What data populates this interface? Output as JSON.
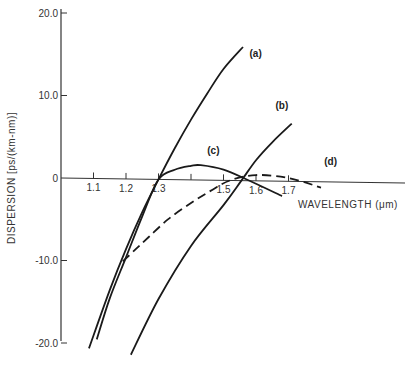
{
  "chart_data": {
    "type": "line",
    "title": "",
    "xlabel": "WAVELENGTH (μm)",
    "ylabel": "DISPERSION [ps/(km-nm)]",
    "xlim": [
      1.0,
      2.1
    ],
    "ylim": [
      -20.0,
      20.0
    ],
    "x_ticks": [
      1.1,
      1.2,
      1.3,
      1.4,
      1.5,
      1.6,
      1.7
    ],
    "x_tick_labels": [
      "1.1",
      "1.2",
      "1.3",
      "",
      "1.5",
      "1.6",
      "1.7"
    ],
    "y_ticks": [
      20.0,
      10.0,
      0,
      -10.0,
      -20.0
    ],
    "y_tick_labels": [
      "20.0",
      "10.0",
      "0",
      "-10.0",
      "-20.0"
    ],
    "grid": false,
    "legend": "inline labels",
    "series": [
      {
        "name": "(a)",
        "style": "solid",
        "x": [
          1.086,
          1.15,
          1.2,
          1.25,
          1.3,
          1.35,
          1.4,
          1.45,
          1.5,
          1.56
        ],
        "y": [
          -20.6,
          -13.5,
          -8.5,
          -4.0,
          0.0,
          3.8,
          7.3,
          10.5,
          13.5,
          16.2
        ]
      },
      {
        "name": "(b)",
        "style": "solid",
        "x": [
          1.215,
          1.3,
          1.4,
          1.5,
          1.555,
          1.6,
          1.65,
          1.71
        ],
        "y": [
          -21.3,
          -14.5,
          -8.0,
          -3.0,
          0.0,
          2.5,
          4.7,
          7.0
        ]
      },
      {
        "name": "(c)",
        "style": "solid",
        "x": [
          1.11,
          1.15,
          1.2,
          1.25,
          1.3,
          1.35,
          1.4,
          1.43,
          1.5,
          1.58,
          1.68
        ],
        "y": [
          -19.5,
          -14.5,
          -9.5,
          -4.5,
          0.0,
          1.2,
          1.7,
          1.8,
          1.3,
          0.0,
          -1.8
        ]
      },
      {
        "name": "(d)",
        "style": "dashed",
        "x": [
          1.19,
          1.23,
          1.27,
          1.33,
          1.4,
          1.46,
          1.52,
          1.6,
          1.7,
          1.8
        ],
        "y": [
          -10.0,
          -8.5,
          -7.0,
          -4.8,
          -2.8,
          -1.3,
          0.0,
          0.7,
          0.4,
          -0.7
        ]
      }
    ],
    "annotations": [
      {
        "text": "(a)",
        "x": 1.58,
        "y": 15.0
      },
      {
        "text": "(b)",
        "x": 1.66,
        "y": 8.8
      },
      {
        "text": "(c)",
        "x": 1.45,
        "y": 3.2
      },
      {
        "text": "(d)",
        "x": 1.81,
        "y": 2.0
      }
    ]
  }
}
